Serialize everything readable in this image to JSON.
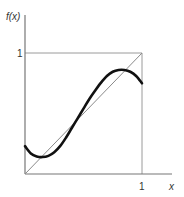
{
  "chart_data": {
    "type": "line",
    "title": "",
    "xlabel": "x",
    "ylabel": "f(x)",
    "xlim": [
      0,
      1
    ],
    "ylim": [
      0,
      1
    ],
    "x_ticks": [
      {
        "value": 1,
        "label": "1"
      }
    ],
    "y_ticks": [
      {
        "value": 1,
        "label": "1"
      }
    ],
    "grid": false,
    "legend": null,
    "unit_square": true,
    "series": [
      {
        "name": "f(x)",
        "style": "thick-black",
        "color": "#111111",
        "x": [
          0.0,
          0.05,
          0.1,
          0.15,
          0.2,
          0.25,
          0.3,
          0.35,
          0.4,
          0.45,
          0.5,
          0.55,
          0.6,
          0.65,
          0.7,
          0.75,
          0.8,
          0.85,
          0.9,
          0.95,
          1.0
        ],
        "y": [
          0.23,
          0.17,
          0.145,
          0.14,
          0.15,
          0.18,
          0.23,
          0.3,
          0.38,
          0.46,
          0.54,
          0.62,
          0.69,
          0.755,
          0.81,
          0.845,
          0.86,
          0.86,
          0.845,
          0.81,
          0.75
        ]
      },
      {
        "name": "y = x",
        "style": "thin-gray-diagonal",
        "color": "#888888",
        "x": [
          0,
          1
        ],
        "y": [
          0,
          1
        ]
      }
    ],
    "annotations": [
      "f(x) intersects y = x at three points (approx. x = 0.15, 0.5, 0.83)"
    ]
  },
  "labels": {
    "y_axis": "f(x)",
    "x_axis": "x",
    "x_tick_1": "1",
    "y_tick_1": "1"
  },
  "colors": {
    "axis": "#777777",
    "box": "#9a9a9a",
    "diagonal": "#8a8a8a",
    "curve": "#111111"
  }
}
